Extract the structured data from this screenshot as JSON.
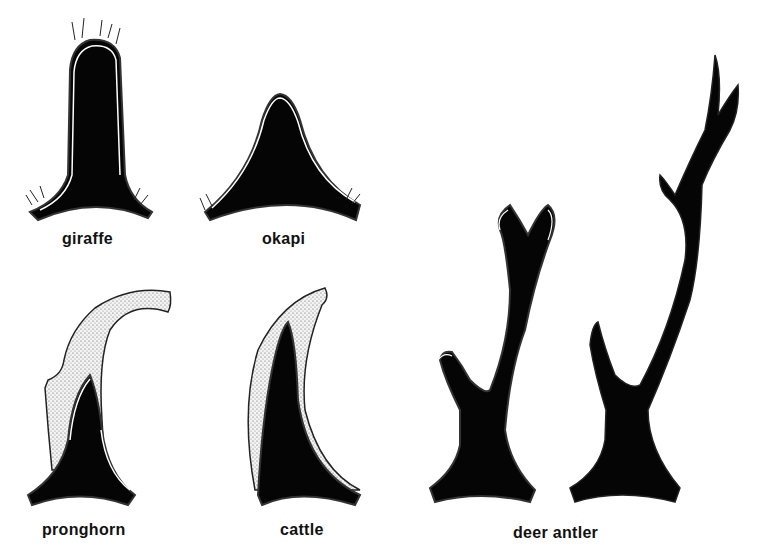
{
  "figure": {
    "colors": {
      "bone": "#050505",
      "sheath": "#e8e8e8",
      "skin_line": "#ffffff",
      "background": "#ffffff"
    },
    "items": [
      {
        "id": "giraffe",
        "label": "giraffe",
        "structure": "ossicone covered by skin and hair"
      },
      {
        "id": "okapi",
        "label": "okapi",
        "structure": "ossicone covered by skin and hair"
      },
      {
        "id": "pronghorn",
        "label": "pronghorn",
        "structure": "bony core with forked keratin sheath"
      },
      {
        "id": "cattle",
        "label": "cattle",
        "structure": "bony core with keratin sheath"
      },
      {
        "id": "deer-antler",
        "label": "deer antler",
        "structure": "antler in velvet and bare antler"
      }
    ]
  }
}
